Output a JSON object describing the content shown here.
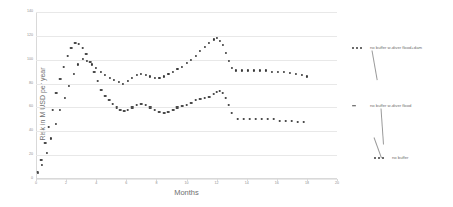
{
  "chart_data": {
    "type": "line",
    "title": "",
    "xlabel": "Months",
    "ylabel": "Risk in M USD per year",
    "xlim": [
      0,
      20
    ],
    "ylim": [
      0,
      140
    ],
    "xticks": [
      0,
      2,
      4,
      6,
      8,
      10,
      12,
      14,
      16,
      18,
      20
    ],
    "yticks": [
      0,
      20,
      40,
      60,
      80,
      100,
      120,
      140
    ],
    "grid": "horizontal",
    "legend_position": "right-callouts",
    "marker_style": "dotted",
    "series": [
      {
        "name": "no buffer w-diver flood+dam",
        "style": "dotted",
        "color": "#3a3a3a",
        "x": [
          0.1,
          0.4,
          0.7,
          1.0,
          1.3,
          1.6,
          1.9,
          2.2,
          2.5,
          2.8,
          3.1,
          3.4,
          3.7,
          4.0,
          4.3,
          4.6,
          4.9,
          5.2,
          5.5,
          5.8,
          6.1,
          6.4,
          6.7,
          7.0,
          7.3,
          7.6,
          7.9,
          8.2,
          8.5,
          8.8,
          9.1,
          9.4,
          9.7,
          10.0,
          10.3,
          10.6,
          10.9,
          11.2,
          11.5,
          11.8,
          12.0,
          12.2,
          12.4,
          12.6,
          12.8,
          13.0,
          13.3,
          13.7,
          14.1,
          14.5,
          14.9,
          15.3,
          15.7,
          16.1,
          16.5,
          16.9,
          17.3,
          17.7,
          18.0
        ],
        "y": [
          5,
          12,
          22,
          34,
          46,
          58,
          68,
          78,
          88,
          96,
          101,
          99,
          96,
          93,
          90,
          87,
          85,
          83,
          81,
          80,
          82,
          85,
          87,
          88,
          87,
          86,
          85,
          85,
          86,
          88,
          90,
          92,
          94,
          97,
          100,
          103,
          107,
          111,
          114,
          117,
          118,
          116,
          112,
          106,
          99,
          93,
          91,
          91,
          91,
          91,
          91,
          91,
          90,
          90,
          90,
          89,
          88,
          87,
          86
        ]
      },
      {
        "name": "no buffer w-diver flood",
        "style": "dashed",
        "color": "#4a4a4a",
        "x": [
          0.1,
          0.35,
          0.6,
          0.85,
          1.1,
          1.35,
          1.6,
          1.85,
          2.1,
          2.35,
          2.6,
          2.85,
          3.1,
          3.35,
          3.6,
          3.85,
          4.1,
          4.35,
          4.6,
          4.85,
          5.1,
          5.35,
          5.6,
          5.85,
          6.1,
          6.4,
          6.7,
          7.0,
          7.3,
          7.6,
          7.9,
          8.2,
          8.5,
          8.8,
          9.1,
          9.4,
          9.7,
          10.0,
          10.3,
          10.6,
          10.9,
          11.2,
          11.5,
          11.8,
          12.0,
          12.2,
          12.4,
          12.6,
          12.8,
          13.0,
          13.4,
          13.8,
          14.2,
          14.6,
          15.0,
          15.4,
          15.8,
          16.2,
          16.6,
          17.0,
          17.4,
          17.8
        ],
        "y": [
          6,
          16,
          30,
          44,
          58,
          72,
          84,
          94,
          103,
          110,
          114,
          113,
          110,
          105,
          98,
          90,
          82,
          75,
          70,
          66,
          63,
          60,
          58,
          57,
          58,
          60,
          62,
          63,
          62,
          60,
          58,
          56,
          55,
          56,
          58,
          60,
          61,
          62,
          64,
          66,
          67,
          68,
          69,
          71,
          73,
          74,
          72,
          68,
          62,
          55,
          50,
          50,
          50,
          50,
          50,
          50,
          50,
          49,
          49,
          49,
          48,
          48
        ]
      },
      {
        "name": "no buffer",
        "style": "dotted",
        "color": "#3a3a3a",
        "note": "lowest callout label"
      }
    ],
    "legend_entries": [
      {
        "label": "no buffer w-diver flood+dam",
        "style": "dotted"
      },
      {
        "label": "no buffer w-diver flood",
        "style": "dashed"
      },
      {
        "label": "no buffer",
        "style": "dotted"
      }
    ]
  },
  "axes": {
    "ylabel": "Risk in M USD per year",
    "xlabel": "Months"
  }
}
